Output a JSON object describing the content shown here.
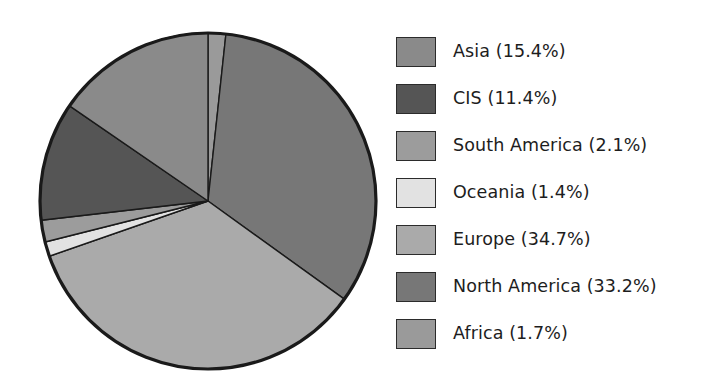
{
  "chart_data": {
    "type": "pie",
    "title": "",
    "subtitle": "",
    "xlabel": "",
    "ylabel": "",
    "units": "percent",
    "legend_position": "right",
    "grid": false,
    "start_angle_deg": 0,
    "direction": "clockwise",
    "categories": [
      "Asia",
      "CIS",
      "South America",
      "Oceania",
      "Europe",
      "North America",
      "Africa"
    ],
    "values": [
      15.4,
      11.4,
      2.1,
      1.4,
      34.7,
      33.2,
      1.7
    ],
    "total": 99.9,
    "slice_draw_order_clockwise_from_12": [
      "Africa",
      "North America",
      "Europe",
      "Oceania",
      "South America",
      "CIS",
      "Asia"
    ],
    "colors": [
      "#8a8a8a",
      "#555555",
      "#9c9c9c",
      "#e2e2e2",
      "#aaaaaa",
      "#777777",
      "#9a9a9a"
    ],
    "outline_color": "#1a1a1a",
    "slices": [
      {
        "label": "Asia",
        "value": 15.4,
        "text": "Asia (15.4%)",
        "color": "#8a8a8a"
      },
      {
        "label": "CIS",
        "value": 11.4,
        "text": "CIS (11.4%)",
        "color": "#555555"
      },
      {
        "label": "South America",
        "value": 2.1,
        "text": "South America (2.1%)",
        "color": "#9c9c9c"
      },
      {
        "label": "Oceania",
        "value": 1.4,
        "text": "Oceania (1.4%)",
        "color": "#e2e2e2"
      },
      {
        "label": "Europe",
        "value": 34.7,
        "text": "Europe (34.7%)",
        "color": "#aaaaaa"
      },
      {
        "label": "North America",
        "value": 33.2,
        "text": "North America (33.2%)",
        "color": "#777777"
      },
      {
        "label": "Africa",
        "value": 1.7,
        "text": "Africa (1.7%)",
        "color": "#9a9a9a"
      }
    ]
  },
  "legend": {
    "items": [
      {
        "label": "Asia (15.4%)",
        "color": "#8a8a8a"
      },
      {
        "label": "CIS (11.4%)",
        "color": "#555555"
      },
      {
        "label": "South America (2.1%)",
        "color": "#9c9c9c"
      },
      {
        "label": "Oceania (1.4%)",
        "color": "#e2e2e2"
      },
      {
        "label": "Europe (34.7%)",
        "color": "#aaaaaa"
      },
      {
        "label": "North America (33.2%)",
        "color": "#777777"
      },
      {
        "label": "Africa (1.7%)",
        "color": "#9a9a9a"
      }
    ]
  }
}
